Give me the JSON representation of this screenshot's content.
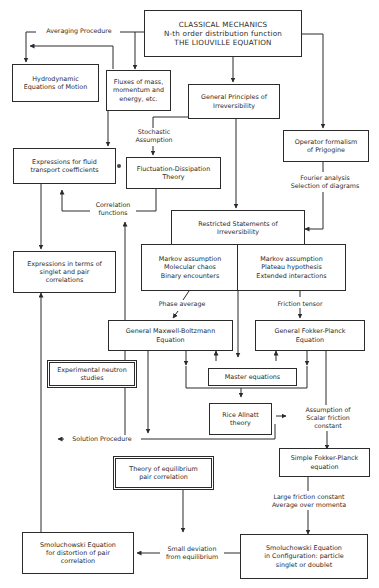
{
  "diagram": {
    "boxes": {
      "classical": "CLASSICAL MECHANICS\nN-th order distribution function\nTHE LIOUVILLE EQUATION",
      "hydrodynamic": "Hydrodynamic\nEquations of Motion",
      "fluxes": "Fluxes of mass,\nmomentum and\nenergy, etc.",
      "general_principles": "General Principles of\nIrreversibility",
      "operator_formalism": "Operator formalism\nof Prigogine",
      "expressions_fluid": "Expressions for fluid\ntransport coefficients",
      "fluctuation_dissipation": "Fluctuation-Dissipation\nTheory",
      "restricted_statements": "Restricted Statements of\nIrreversibility",
      "markov_molecular": "Markov assumption\nMolecular chaos\nBinary encounters",
      "markov_plateau": "Markov assumption\nPlateau hypothesis\nExtended interactions",
      "expressions_singlet": "Expressions in terms of\nsinglet and pair\ncorrelations",
      "maxwell_boltzmann": "General Maxwell-Boltzmann\nEquation",
      "fokker_planck_general": "General Fokker-Planck\nEquation",
      "experimental_neutron": "Experimental neutron\nstudies",
      "master_equations": "Master equations",
      "rice_allnatt": "Rice Allnatt\ntheory",
      "simple_fokker_planck": "Simple Fokker-Planck\nequation",
      "equilibrium_pair": "Theory of equilibrium\npair correlation",
      "smoluchowski_distortion": "Smoluchowski Equation\nfor distortion of pair\ncorrelation",
      "smoluchowski_configuration": "Smoluchowski Equation\nin Configuration: particle\nsinglet or doublet"
    },
    "labels": {
      "averaging_procedure": "Averaging Procedure",
      "stochastic_assumption": "Stochastic\nAssumption",
      "correlation_functions": "Correlation\nfunctions",
      "fourier_analysis": "Fourier analysis\nSelection of diagrams",
      "phase_average": "Phase average",
      "friction_tensor": "Friction tensor",
      "scalar_friction": "Assumption of\nScalar friction\nconstant",
      "solution_procedure": "Solution Procedure",
      "large_friction": "Large friction constant\nAverage over momenta",
      "small_deviation": "Small deviation\nfrom equilibrium"
    },
    "colors": {
      "line": "#2b2b2b",
      "background": "#ffffff"
    }
  }
}
